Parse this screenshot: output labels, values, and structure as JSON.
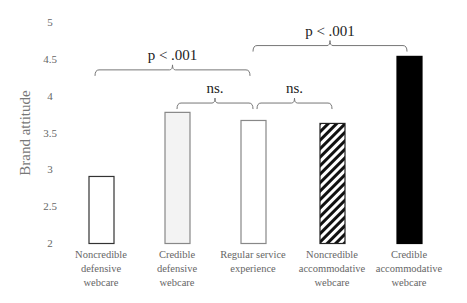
{
  "chart_data": {
    "type": "bar",
    "title": "",
    "xlabel": "",
    "ylabel": "Brand attitude",
    "ylim": [
      2,
      5
    ],
    "yticks": [
      "2",
      "2.5",
      "3",
      "3.5",
      "4",
      "4.5",
      "5"
    ],
    "grid": false,
    "categories": [
      [
        "Noncredible",
        "defensive",
        "webcare"
      ],
      [
        "Credible",
        "defensive",
        "webcare"
      ],
      [
        "Regular service",
        "experience"
      ],
      [
        "Noncredible",
        "accommodative",
        "webcare"
      ],
      [
        "Credible",
        "accommodative",
        "webcare"
      ]
    ],
    "values": [
      2.91,
      3.78,
      3.67,
      3.63,
      4.54
    ],
    "bar_styles": [
      {
        "fill": "#ffffff",
        "stroke": "#333333",
        "pattern": "none"
      },
      {
        "fill": "#f3f3f3",
        "stroke": "#888888",
        "pattern": "none"
      },
      {
        "fill": "#ffffff",
        "stroke": "#888888",
        "pattern": "none"
      },
      {
        "fill": "#ffffff",
        "stroke": "#222222",
        "pattern": "diagonal-hatch"
      },
      {
        "fill": "#000000",
        "stroke": "#000000",
        "pattern": "none"
      }
    ],
    "annotations": [
      {
        "label": "p < .001",
        "from": 0,
        "to": 2,
        "level": 4.35
      },
      {
        "label": "ns.",
        "from": 1,
        "to": 2,
        "level": 3.9
      },
      {
        "label": "p < .001",
        "from": 2,
        "to": 4,
        "level": 4.68
      },
      {
        "label": "ns.",
        "from": 2,
        "to": 3,
        "level": 3.9
      }
    ]
  }
}
